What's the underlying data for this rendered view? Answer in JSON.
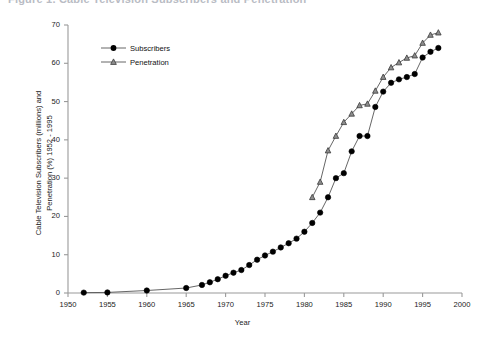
{
  "figure": {
    "caption_clipped": "Figure 1.  Cable Television Subscribers and Penetration",
    "background": "#ffffff"
  },
  "chart_data": {
    "type": "line",
    "title": "",
    "xlabel": "Year",
    "ylabel": "Cable Television Subscribers (millions) and Penetration (%) 1952 - 1995",
    "ylabel_line1": "Cable Television Subscribers (millions) and",
    "ylabel_line2": "Penetration (%) 1952 - 1995",
    "xlim": [
      1950,
      2000
    ],
    "ylim": [
      0,
      70
    ],
    "xticks": [
      1950,
      1955,
      1960,
      1965,
      1970,
      1975,
      1980,
      1985,
      1990,
      1995,
      2000
    ],
    "yticks": [
      0,
      10,
      20,
      30,
      40,
      50,
      60,
      70
    ],
    "xtick_labels": [
      "1950",
      "1955",
      "1960",
      "1965",
      "1970",
      "1975",
      "1980",
      "1985",
      "1990",
      "1995",
      "2000"
    ],
    "ytick_labels": [
      "0",
      "10",
      "20",
      "30",
      "40",
      "50",
      "60",
      "70"
    ],
    "grid": false,
    "legend_position": "upper-left-inside",
    "colors": {
      "subscribers": "#000000",
      "penetration": "#555555",
      "axis": "#9a9a9a",
      "line": "#555555"
    },
    "series": [
      {
        "name": "Subscribers",
        "marker": "filled-circle",
        "x": [
          1952,
          1955,
          1960,
          1965,
          1967,
          1968,
          1969,
          1970,
          1971,
          1972,
          1973,
          1974,
          1975,
          1976,
          1977,
          1978,
          1979,
          1980,
          1981,
          1982,
          1983,
          1984,
          1985,
          1986,
          1987,
          1988,
          1989,
          1990,
          1991,
          1992,
          1993,
          1994,
          1995,
          1996,
          1997
        ],
        "values": [
          0.1,
          0.15,
          0.65,
          1.3,
          2.1,
          2.8,
          3.6,
          4.5,
          5.3,
          6.0,
          7.3,
          8.7,
          9.8,
          10.8,
          11.9,
          13.0,
          14.2,
          16.0,
          18.3,
          21.0,
          25.0,
          30.0,
          31.3,
          37.0,
          41.0,
          41.0,
          48.6,
          52.6,
          54.9,
          55.8,
          56.4,
          57.2,
          61.5,
          63.0,
          64.0
        ],
        "units": "millions"
      },
      {
        "name": "Penetration",
        "marker": "open-triangle",
        "x": [
          1981,
          1982,
          1983,
          1984,
          1985,
          1986,
          1987,
          1988,
          1989,
          1990,
          1991,
          1992,
          1993,
          1994,
          1995,
          1996,
          1997
        ],
        "values": [
          25.0,
          29.0,
          37.2,
          41.0,
          44.6,
          46.8,
          49.0,
          49.4,
          52.8,
          56.4,
          58.9,
          60.2,
          61.4,
          62.0,
          65.3,
          67.4,
          68.0
        ],
        "units": "percent"
      }
    ]
  },
  "legend": {
    "items": [
      {
        "label": "Subscribers",
        "marker": "filled-circle"
      },
      {
        "label": "Penetration",
        "marker": "open-triangle"
      }
    ]
  }
}
